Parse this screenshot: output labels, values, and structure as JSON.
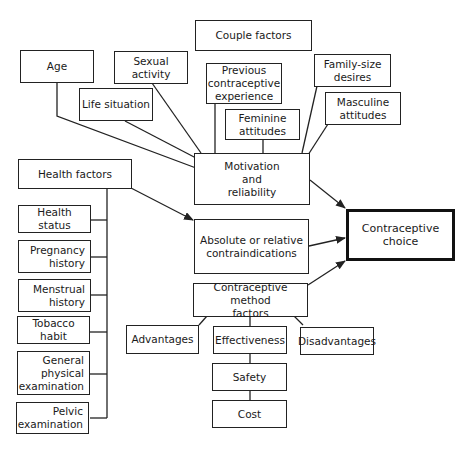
{
  "diagram": {
    "nodes": {
      "couple_factors": "Couple factors",
      "age": "Age",
      "sexual_activity": "Sexual activity",
      "previous_experience": "Previous\ncontraceptive\nexperience",
      "family_size": "Family-size\ndesires",
      "life_situation": "Life situation",
      "feminine_attitudes": "Feminine\nattitudes",
      "masculine_attitudes": "Masculine\nattitudes",
      "motivation": "Motivation\nand\nreliability",
      "health_factors": "Health factors",
      "health_status": "Health status",
      "pregnancy_history": "Pregnancy\nhistory",
      "menstrual_history": "Menstrual\nhistory",
      "tobacco_habit": "Tobacco habit",
      "general_exam": "General\nphysical\nexamination",
      "pelvic_exam": "Pelvic\nexamination",
      "contraindications": "Absolute or relative\ncontraindications",
      "contraceptive_choice": "Contraceptive choice",
      "method_factors": "Contraceptive method\nfactors",
      "advantages": "Advantages",
      "effectiveness": "Effectiveness",
      "disadvantages": "Disadvantages",
      "safety": "Safety",
      "cost": "Cost"
    },
    "edges": [
      {
        "from": "age",
        "to": "motivation"
      },
      {
        "from": "sexual_activity",
        "to": "motivation"
      },
      {
        "from": "life_situation",
        "to": "motivation"
      },
      {
        "from": "previous_experience",
        "to": "motivation"
      },
      {
        "from": "feminine_attitudes",
        "to": "motivation"
      },
      {
        "from": "family_size",
        "to": "motivation"
      },
      {
        "from": "masculine_attitudes",
        "to": "motivation"
      },
      {
        "from": "motivation",
        "to": "contraceptive_choice",
        "arrow": true
      },
      {
        "from": "health_factors",
        "to": "contraindications",
        "arrow": true
      },
      {
        "from": "contraindications",
        "to": "contraceptive_choice",
        "arrow": true
      },
      {
        "from": "method_factors",
        "to": "contraceptive_choice",
        "arrow": true
      },
      {
        "from": "health_factors",
        "to": "health_status"
      },
      {
        "from": "health_factors",
        "to": "pregnancy_history"
      },
      {
        "from": "health_factors",
        "to": "menstrual_history"
      },
      {
        "from": "health_factors",
        "to": "tobacco_habit"
      },
      {
        "from": "health_factors",
        "to": "general_exam"
      },
      {
        "from": "health_factors",
        "to": "pelvic_exam"
      },
      {
        "from": "method_factors",
        "to": "advantages"
      },
      {
        "from": "method_factors",
        "to": "effectiveness"
      },
      {
        "from": "method_factors",
        "to": "disadvantages"
      },
      {
        "from": "effectiveness",
        "to": "safety"
      },
      {
        "from": "safety",
        "to": "cost"
      }
    ]
  }
}
